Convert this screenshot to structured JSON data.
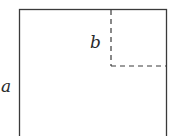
{
  "diagram": {
    "labels": {
      "outer_side": "a",
      "inner_side": "b"
    },
    "colors": {
      "line": "#3a3a3a",
      "background": "#ffffff"
    }
  }
}
